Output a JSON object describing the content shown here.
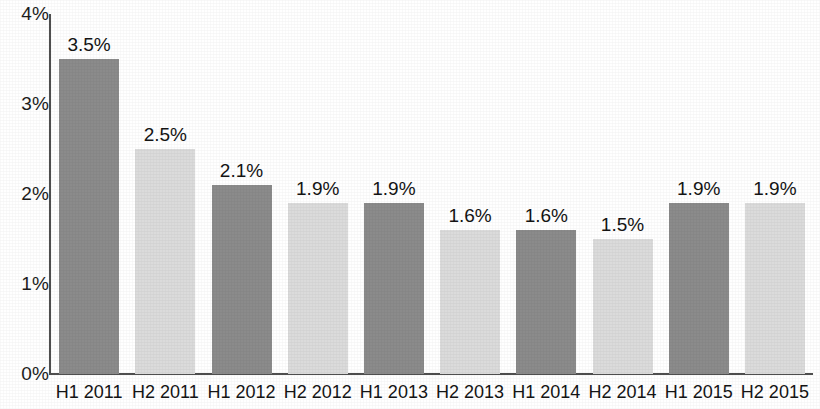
{
  "chart_data": {
    "type": "bar",
    "title": "",
    "subtitle": "",
    "xlabel": "",
    "ylabel": "",
    "ylim": [
      0,
      4
    ],
    "grid": false,
    "legend": null,
    "y_tick_labels": [
      "4%",
      "3%",
      "2%",
      "1%",
      "0%"
    ],
    "y_tick_values": [
      4,
      3,
      2,
      1,
      0
    ],
    "categories": [
      "H1 2011",
      "H2 2011",
      "H1 2012",
      "H2 2012",
      "H1 2013",
      "H2 2013",
      "H1 2014",
      "H2 2014",
      "H1 2015",
      "H2 2015"
    ],
    "values": [
      3.5,
      2.5,
      2.1,
      1.9,
      1.9,
      1.6,
      1.6,
      1.5,
      1.9,
      1.9
    ],
    "data_labels": [
      "3.5%",
      "2.5%",
      "2.1%",
      "1.9%",
      "1.9%",
      "1.6%",
      "1.6%",
      "1.5%",
      "1.9%",
      "1.9%"
    ],
    "bar_shades": [
      "dark",
      "light",
      "dark",
      "light",
      "dark",
      "light",
      "dark",
      "light",
      "dark",
      "light"
    ],
    "colors": {
      "bar_dark": "#8b8b8b",
      "bar_light": "#dbdbdb",
      "axis": "#4f4f4f",
      "text": "#141414",
      "background": "#ffffff"
    }
  }
}
